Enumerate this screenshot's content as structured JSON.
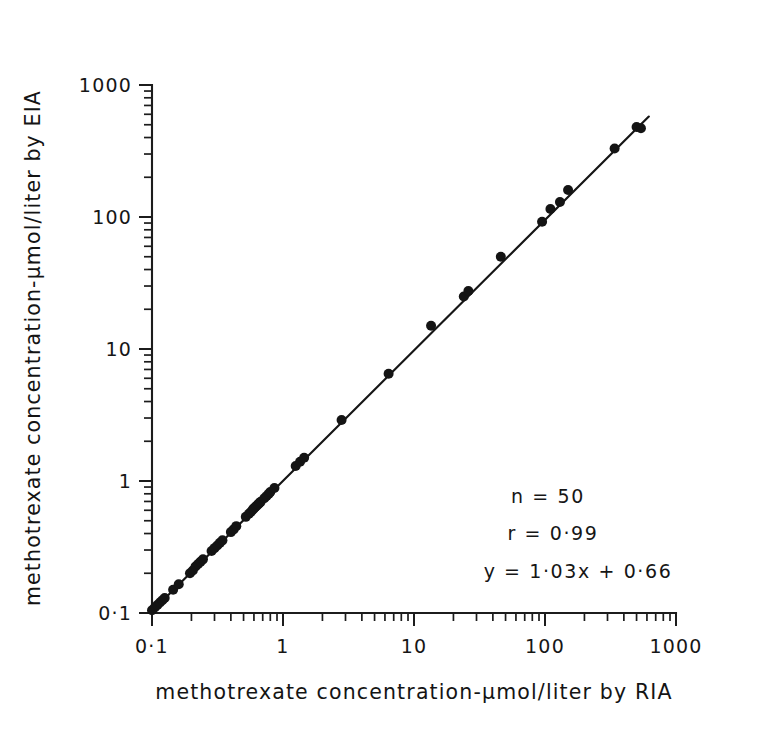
{
  "chart_data": {
    "type": "scatter",
    "title": "",
    "xlabel": "methotrexate concentration-μmol/liter by RIA",
    "ylabel": "methotrexate concentration-μmol/liter by EIA",
    "xscale": "log",
    "yscale": "log",
    "xlim": [
      0.1,
      1000
    ],
    "ylim": [
      0.1,
      1000
    ],
    "grid": false,
    "legend": null,
    "xticks": [
      "0·1",
      "1",
      "10",
      "100",
      "1000"
    ],
    "xtick_values": [
      0.1,
      1,
      10,
      100,
      1000
    ],
    "yticks": [
      "0·1",
      "1",
      "10",
      "100",
      "1000"
    ],
    "ytick_values": [
      0.1,
      1,
      10,
      100,
      1000
    ],
    "minor_ticks": true,
    "marker": "filled-circle",
    "marker_color": "#141414",
    "series": [
      {
        "name": "methotrexate samples",
        "x": [
          0.1,
          0.105,
          0.11,
          0.115,
          0.12,
          0.125,
          0.145,
          0.16,
          0.195,
          0.205,
          0.215,
          0.225,
          0.235,
          0.245,
          0.285,
          0.3,
          0.315,
          0.33,
          0.345,
          0.4,
          0.42,
          0.44,
          0.52,
          0.55,
          0.57,
          0.59,
          0.6,
          0.615,
          0.63,
          0.645,
          0.66,
          0.675,
          0.72,
          0.75,
          0.78,
          0.8,
          0.86,
          1.25,
          1.35,
          1.45,
          2.8,
          6.4,
          13.5,
          24.0,
          26.0,
          46.0,
          95.0,
          110.0,
          130.0,
          150.0,
          340.0,
          500.0,
          540.0
        ],
        "y": [
          0.105,
          0.11,
          0.115,
          0.12,
          0.125,
          0.13,
          0.15,
          0.165,
          0.2,
          0.21,
          0.225,
          0.235,
          0.245,
          0.255,
          0.295,
          0.31,
          0.325,
          0.34,
          0.355,
          0.41,
          0.43,
          0.455,
          0.535,
          0.565,
          0.585,
          0.61,
          0.62,
          0.635,
          0.65,
          0.665,
          0.68,
          0.695,
          0.74,
          0.77,
          0.8,
          0.825,
          0.885,
          1.3,
          1.4,
          1.5,
          2.9,
          6.5,
          15.0,
          25.0,
          27.5,
          50.0,
          92.0,
          115.0,
          130.0,
          160.0,
          330.0,
          480.0,
          470.0
        ]
      }
    ],
    "fit_line": {
      "equation": "y = 1·03x + 0·66",
      "slope": 1.03,
      "intercept": 0.66,
      "x_start": 0.1,
      "x_end": 620.0
    },
    "annotations": {
      "n_label": "n = 50",
      "r_label": "r =  0·99",
      "equation_label": "y =  1·03x + 0·66",
      "n_value": 50,
      "r_value": 0.99
    }
  },
  "colors": {
    "ink": "#161616",
    "background": "#ffffff",
    "marker": "#141414"
  }
}
